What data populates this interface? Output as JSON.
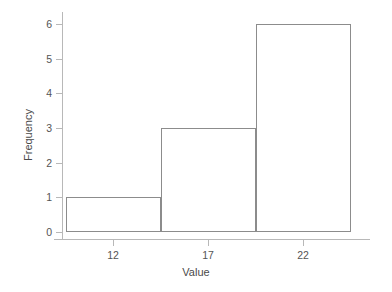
{
  "chart_data": {
    "type": "bar",
    "title": "",
    "subtitle": "",
    "xlabel": "Value",
    "ylabel": "Frequency",
    "xlim": [
      9.4,
      25.1
    ],
    "ylim": [
      0,
      6
    ],
    "grid": false,
    "legend": null,
    "x_ticks": [
      {
        "value": 12,
        "label": "12"
      },
      {
        "value": 17,
        "label": "17"
      },
      {
        "value": 22,
        "label": "22"
      }
    ],
    "y_ticks": [
      {
        "value": 0,
        "label": "0"
      },
      {
        "value": 1,
        "label": "1"
      },
      {
        "value": 2,
        "label": "2"
      },
      {
        "value": 3,
        "label": "3"
      },
      {
        "value": 4,
        "label": "4"
      },
      {
        "value": 5,
        "label": "5"
      },
      {
        "value": 6,
        "label": "6"
      }
    ],
    "bins": [
      {
        "label": "9.5-14.5",
        "x_start": 9.5,
        "x_end": 14.5,
        "value": 1
      },
      {
        "label": "14.5-19.5",
        "x_start": 14.5,
        "x_end": 19.5,
        "value": 3
      },
      {
        "label": "19.5-24.5",
        "x_start": 19.5,
        "x_end": 24.5,
        "value": 6
      }
    ],
    "categories": [
      "9.5-14.5",
      "14.5-19.5",
      "19.5-24.5"
    ],
    "values": [
      1,
      3,
      6
    ],
    "colors": {
      "bar_edge": "#8c8c8c",
      "bar_fill": "transparent",
      "axis": "#b8b8b8",
      "tick_label": "#545454",
      "axis_title": "#4a4a4a",
      "background": "#ffffff"
    }
  }
}
